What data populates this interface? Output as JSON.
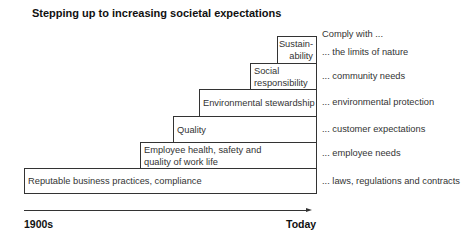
{
  "title": "Stepping up to increasing societal expectations",
  "header_right": "Comply with ...",
  "steps": [
    {
      "label_line1": "Reputable business practices, compliance",
      "label_line2": "",
      "expectation": "... laws, regulations and contracts"
    },
    {
      "label_line1": "Employee health, safety and",
      "label_line2": "quality of work life",
      "expectation": "... employee needs"
    },
    {
      "label_line1": "Quality",
      "label_line2": "",
      "expectation": "... customer expectations"
    },
    {
      "label_line1": "Environmental stewardship",
      "label_line2": "",
      "expectation": "... environmental protection"
    },
    {
      "label_line1": "Social",
      "label_line2": "responsibility",
      "expectation": "... community needs"
    },
    {
      "label_line1": "Sustain-",
      "label_line2": "ability",
      "expectation": "... the limits of nature"
    }
  ],
  "axis": {
    "start": "1900s",
    "end": "Today"
  }
}
